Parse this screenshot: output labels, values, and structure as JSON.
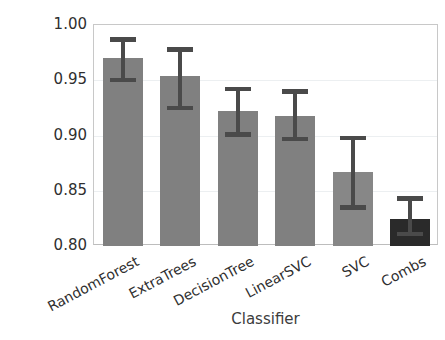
{
  "chart_data": {
    "type": "bar",
    "title": "",
    "xlabel": "Classifier",
    "ylabel": "f-score",
    "categories": [
      "RandomForest",
      "ExtraTrees",
      "DecisionTree",
      "LinearSVC",
      "SVC",
      "Combs"
    ],
    "values": [
      0.97,
      0.954,
      0.922,
      0.918,
      0.867,
      0.824
    ],
    "error_high": [
      0.989,
      0.98,
      0.944,
      0.942,
      0.9,
      0.845
    ],
    "error_low": [
      0.948,
      0.923,
      0.899,
      0.895,
      0.833,
      0.809
    ],
    "error_plus": [
      0.019,
      0.026,
      0.022,
      0.024,
      0.033,
      0.021
    ],
    "error_minus": [
      0.022,
      0.031,
      0.023,
      0.023,
      0.034,
      0.015
    ],
    "ylim": [
      0.8,
      1.0
    ],
    "yticks": [
      "0.80",
      "0.85",
      "0.90",
      "0.95",
      "1.00"
    ],
    "ytick_values": [
      0.8,
      0.85,
      0.9,
      0.95,
      1.0
    ],
    "grid": true,
    "grid_axis": "y",
    "legend": null,
    "bar_colors": [
      "#808080",
      "#808080",
      "#808080",
      "#808080",
      "#878787",
      "#2a2a2a"
    ],
    "errorbar_color": "#4a4a4a",
    "grid_color": "#eceff1",
    "axes_color": "#c8c8c8",
    "text_color": "#2f2f2f",
    "xtick_rotation": -28
  }
}
